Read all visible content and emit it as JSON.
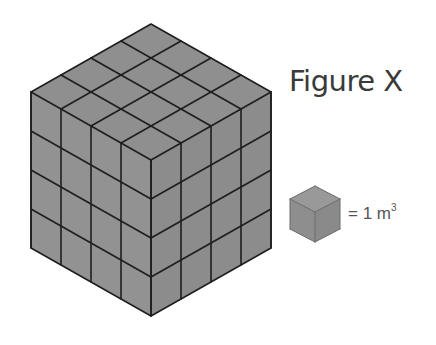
{
  "figure": {
    "title": "Figure X",
    "legend": {
      "equals": "= 1 m",
      "exponent": "3",
      "unit_label": "1 m³"
    }
  },
  "colors": {
    "face_fill": "#8f8f8f",
    "face_fill_left": "#929292",
    "face_fill_right": "#8c8c8c",
    "edge": "#1e1e1e",
    "text": "#3a3a3a",
    "legend_text": "#555555",
    "background": "#ffffff"
  },
  "cube": {
    "dimensions": [
      4,
      4,
      4
    ],
    "unit_count": 64,
    "top": [
      151,
      24
    ],
    "unit_left": [
      -30,
      17
    ],
    "unit_right": [
      30,
      17
    ],
    "unit_down": [
      0,
      39
    ]
  },
  "unit_cube": {
    "top": [
      315,
      186
    ],
    "unit_left": [
      -25,
      13
    ],
    "unit_right": [
      25,
      13
    ],
    "unit_down": [
      0,
      30
    ]
  }
}
